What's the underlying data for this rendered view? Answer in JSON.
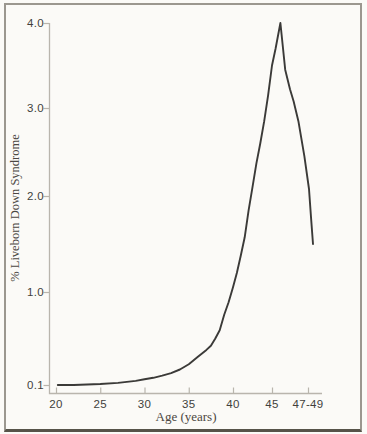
{
  "figure": {
    "background_color": "#fbfaf7",
    "frame_border_color": "#9b978f",
    "frame_bottom_border_color": "#565349"
  },
  "chart_data": {
    "type": "line",
    "title": "",
    "xlabel": "Age (years)",
    "ylabel": "% Liveborn Down Syndrome",
    "grid": false,
    "legend": "none",
    "axis_color": "#b9b5ad",
    "line_color": "#3b3a38",
    "x_axis_range": [
      20,
      49
    ],
    "y_axis_range": [
      0.1,
      4.0
    ],
    "x_tick_labels": [
      "20",
      "25",
      "30",
      "35",
      "40",
      "45",
      "47-49"
    ],
    "x_tick_ages": [
      20,
      25,
      30,
      35,
      40,
      45,
      48
    ],
    "y_tick_labels": [
      "0.1",
      "1.0",
      "2.0",
      "3.0",
      "4.0"
    ],
    "y_tick_values": [
      0.1,
      1.0,
      2.0,
      3.0,
      4.0
    ],
    "series": [
      {
        "name": "% liveborn Down syndrome by maternal age",
        "points": [
          [
            20.2,
            0.1
          ],
          [
            22,
            0.1
          ],
          [
            25,
            0.11
          ],
          [
            27,
            0.12
          ],
          [
            29,
            0.14
          ],
          [
            30,
            0.155
          ],
          [
            31,
            0.17
          ],
          [
            32,
            0.19
          ],
          [
            33,
            0.215
          ],
          [
            34,
            0.25
          ],
          [
            35,
            0.3
          ],
          [
            36,
            0.37
          ],
          [
            37,
            0.44
          ],
          [
            37.5,
            0.48
          ],
          [
            38,
            0.55
          ],
          [
            38.5,
            0.63
          ],
          [
            39,
            0.78
          ],
          [
            39.5,
            0.9
          ],
          [
            40,
            1.05
          ],
          [
            40.5,
            1.2
          ],
          [
            41,
            1.38
          ],
          [
            41.5,
            1.57
          ],
          [
            42,
            1.85
          ],
          [
            42.5,
            2.1
          ],
          [
            43,
            2.37
          ],
          [
            43.5,
            2.6
          ],
          [
            44,
            2.85
          ],
          [
            44.5,
            3.15
          ],
          [
            45,
            3.5
          ],
          [
            45.3,
            3.7
          ],
          [
            45.7,
            4.0
          ],
          [
            46.1,
            3.45
          ],
          [
            46.5,
            3.22
          ],
          [
            46.8,
            3.08
          ],
          [
            47.2,
            2.85
          ],
          [
            47.7,
            2.45
          ],
          [
            48.2,
            2.08
          ],
          [
            48.6,
            1.78
          ],
          [
            49,
            1.5
          ]
        ]
      }
    ]
  }
}
